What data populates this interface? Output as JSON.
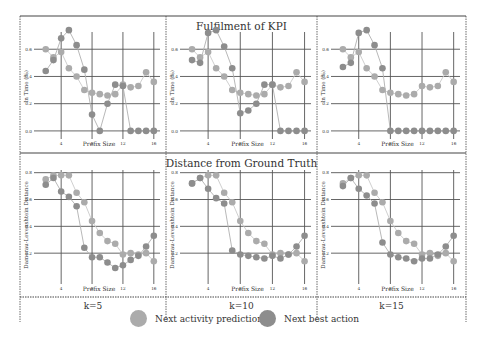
{
  "chart_data": [
    {
      "type": "line",
      "panel": "top-left",
      "title": "",
      "row_title": "Fulfilment of KPI",
      "k_label": "k=5",
      "xlabel": "Prefix Size",
      "ylabel": "In Time (%)",
      "x": [
        2,
        3,
        4,
        5,
        6,
        7,
        8,
        9,
        10,
        11,
        12,
        13,
        14,
        15,
        16
      ],
      "xticks": [
        4,
        8,
        12,
        16
      ],
      "yticks": [
        0.0,
        0.2,
        0.4,
        0.6
      ],
      "ylim": [
        -0.03,
        0.8
      ],
      "xlim": [
        1,
        16.8
      ],
      "series": [
        {
          "name": "Next activity prediction",
          "values": [
            0.6,
            0.54,
            0.58,
            0.46,
            0.4,
            0.3,
            0.28,
            0.27,
            0.26,
            0.27,
            0.34,
            0.32,
            0.33,
            0.43,
            0.36
          ]
        },
        {
          "name": "Next best action",
          "values": [
            0.44,
            0.52,
            0.68,
            0.74,
            0.63,
            0.45,
            0.12,
            0.0,
            0.2,
            0.34,
            0.33,
            0.0,
            0.0,
            0.0,
            0.0
          ]
        }
      ]
    },
    {
      "type": "line",
      "panel": "top-middle",
      "title": "Fulfilment of KPI",
      "k_label": "k=10",
      "xlabel": "Prefix Size",
      "ylabel": "In Time (%)",
      "x": [
        2,
        3,
        4,
        5,
        6,
        7,
        8,
        9,
        10,
        11,
        12,
        13,
        14,
        15,
        16
      ],
      "xticks": [
        4,
        8,
        12,
        16
      ],
      "yticks": [
        0.0,
        0.2,
        0.4,
        0.6
      ],
      "ylim": [
        -0.03,
        0.8
      ],
      "xlim": [
        1,
        16.8
      ],
      "series": [
        {
          "name": "Next activity prediction",
          "values": [
            0.6,
            0.54,
            0.58,
            0.46,
            0.4,
            0.3,
            0.28,
            0.27,
            0.26,
            0.27,
            0.34,
            0.32,
            0.33,
            0.43,
            0.36
          ]
        },
        {
          "name": "Next best action",
          "values": [
            0.52,
            0.5,
            0.72,
            0.74,
            0.62,
            0.46,
            0.13,
            0.15,
            0.2,
            0.34,
            0.34,
            0.0,
            0.0,
            0.0,
            0.0
          ]
        }
      ]
    },
    {
      "type": "line",
      "panel": "top-right",
      "title": "",
      "k_label": "k=15",
      "xlabel": "Prefix Size",
      "ylabel": "In Time (%)",
      "x": [
        2,
        3,
        4,
        5,
        6,
        7,
        8,
        9,
        10,
        11,
        12,
        13,
        14,
        15,
        16
      ],
      "xticks": [
        4,
        8,
        12,
        16
      ],
      "yticks": [
        0.0,
        0.2,
        0.4,
        0.6
      ],
      "ylim": [
        -0.03,
        0.8
      ],
      "xlim": [
        1,
        16.8
      ],
      "series": [
        {
          "name": "Next activity prediction",
          "values": [
            0.6,
            0.54,
            0.58,
            0.46,
            0.4,
            0.3,
            0.28,
            0.27,
            0.26,
            0.27,
            0.33,
            0.32,
            0.33,
            0.43,
            0.36
          ]
        },
        {
          "name": "Next best action",
          "values": [
            0.47,
            0.5,
            0.72,
            0.74,
            0.63,
            0.46,
            0.0,
            0.0,
            0.0,
            0.0,
            0.0,
            0.0,
            0.0,
            0.0,
            0.0
          ]
        }
      ]
    },
    {
      "type": "line",
      "panel": "bottom-left",
      "title": "",
      "row_title": "Distance from Ground Truth",
      "k_label": "k=5",
      "xlabel": "Prefix Size",
      "ylabel": "Damerau-Levenshtein Distance",
      "x": [
        2,
        3,
        4,
        5,
        6,
        7,
        8,
        9,
        10,
        11,
        12,
        13,
        14,
        15,
        16
      ],
      "xticks": [
        4,
        8,
        12,
        16
      ],
      "yticks": [
        0.2,
        0.4,
        0.6,
        0.8
      ],
      "ylim": [
        0.0,
        0.82
      ],
      "xlim": [
        1,
        16.8
      ],
      "series": [
        {
          "name": "Next activity prediction",
          "values": [
            0.75,
            0.78,
            0.78,
            0.78,
            0.65,
            0.58,
            0.44,
            0.35,
            0.29,
            0.27,
            0.19,
            0.2,
            0.19,
            0.2,
            0.14
          ]
        },
        {
          "name": "Next best action",
          "values": [
            0.71,
            0.76,
            0.66,
            0.62,
            0.55,
            0.24,
            0.17,
            0.17,
            0.13,
            0.09,
            0.11,
            0.15,
            0.18,
            0.25,
            0.33
          ]
        }
      ]
    },
    {
      "type": "line",
      "panel": "bottom-middle",
      "title": "Distance from Ground Truth",
      "k_label": "k=10",
      "xlabel": "Prefix Size",
      "ylabel": "Damerau-Levenshtein Distance",
      "x": [
        2,
        3,
        4,
        5,
        6,
        7,
        8,
        9,
        10,
        11,
        12,
        13,
        14,
        15,
        16
      ],
      "xticks": [
        4,
        8,
        12,
        16
      ],
      "yticks": [
        0.2,
        0.4,
        0.6,
        0.8
      ],
      "ylim": [
        0.0,
        0.82
      ],
      "xlim": [
        1,
        16.8
      ],
      "series": [
        {
          "name": "Next activity prediction",
          "values": [
            0.72,
            0.76,
            0.78,
            0.78,
            0.65,
            0.58,
            0.44,
            0.35,
            0.29,
            0.27,
            0.19,
            0.2,
            0.19,
            0.2,
            0.14
          ]
        },
        {
          "name": "Next best action",
          "values": [
            0.72,
            0.76,
            0.68,
            0.61,
            0.57,
            0.22,
            0.19,
            0.18,
            0.17,
            0.16,
            0.18,
            0.16,
            0.19,
            0.25,
            0.33
          ]
        }
      ]
    },
    {
      "type": "line",
      "panel": "bottom-right",
      "title": "",
      "k_label": "k=15",
      "xlabel": "Prefix Size",
      "ylabel": "Damerau-Levenshtein Distance",
      "x": [
        2,
        3,
        4,
        5,
        6,
        7,
        8,
        9,
        10,
        11,
        12,
        13,
        14,
        15,
        16
      ],
      "xticks": [
        4,
        8,
        12,
        16
      ],
      "yticks": [
        0.2,
        0.4,
        0.6,
        0.8
      ],
      "ylim": [
        0.0,
        0.82
      ],
      "xlim": [
        1,
        16.8
      ],
      "series": [
        {
          "name": "Next activity prediction",
          "values": [
            0.72,
            0.76,
            0.78,
            0.78,
            0.65,
            0.58,
            0.44,
            0.35,
            0.29,
            0.27,
            0.19,
            0.2,
            0.18,
            0.2,
            0.14
          ]
        },
        {
          "name": "Next best action",
          "values": [
            0.7,
            0.76,
            0.68,
            0.63,
            0.57,
            0.28,
            0.19,
            0.17,
            0.16,
            0.14,
            0.16,
            0.16,
            0.19,
            0.25,
            0.33
          ]
        }
      ]
    }
  ],
  "titles": {
    "top": "Fulfilment of KPI",
    "bottom": "Distance from Ground Truth"
  },
  "k_labels": [
    "k=5",
    "k=10",
    "k=15"
  ],
  "legend": [
    {
      "label": "Next activity prediction",
      "color": "#ababab"
    },
    {
      "label": "Next best action",
      "color": "#8d8d8d"
    }
  ],
  "colors": {
    "series_light": "#ababab",
    "series_dark": "#8d8d8d",
    "line_light": "#c9c9c9",
    "line_dark": "#b0b0b0",
    "grid": "#555555",
    "frame": "#444444"
  }
}
